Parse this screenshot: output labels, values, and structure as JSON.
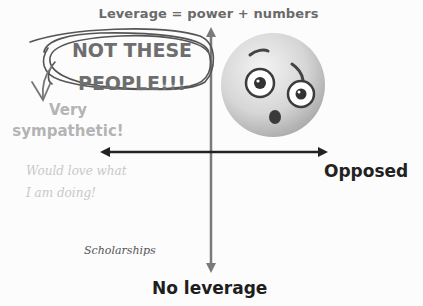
{
  "diagram": {
    "title": "Leverage = power + numbers",
    "axes": {
      "top_label": "Leverage = power + numbers",
      "bottom_label": "No leverage",
      "right_label": "Opposed",
      "left_label": "Very sympathetic!"
    },
    "callout": {
      "line1": "NOT THESE",
      "line2": "PEOPLE!!!"
    },
    "left_annotation": {
      "line1": "Very",
      "line2": "sympathetic!"
    },
    "handwritten_note": {
      "line1": "Would love what",
      "line2": "I am doing!"
    },
    "point_label": "Scholarships",
    "emoji": "flushed-face",
    "colors": {
      "title": "#6a6a6a",
      "callout_text": "#6e6e6e",
      "scribble": "#555555",
      "sympathetic_text": "#b4b4b4",
      "handwritten": "#c8c8c8",
      "axis_h": "#222222",
      "axis_v": "#7a7a7a",
      "opposed": "#222222",
      "no_leverage": "#1e1e1e"
    }
  }
}
